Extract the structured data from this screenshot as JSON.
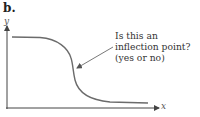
{
  "figure": {
    "panel_label": "b.",
    "y_axis_label": "y",
    "x_axis_label": "x",
    "annotation": {
      "lines": [
        "Is this an",
        "inflection point?",
        "(yes or no)"
      ]
    },
    "colors": {
      "curve": "#6b6b6b",
      "axes": "#444444",
      "text": "#333333"
    }
  }
}
